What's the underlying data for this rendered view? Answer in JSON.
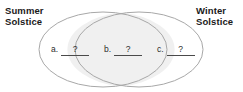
{
  "figure": {
    "type": "venn-diagram",
    "width": 243,
    "height": 92,
    "background_color": "#ffffff",
    "outline_color": "#a8a8a8",
    "overlap_fill_color": "#f0f0f0",
    "text_color": "#1a1a1a"
  },
  "headings": {
    "left": "Summer\nSolstice",
    "right": "Winter\nSolstice"
  },
  "regions": [
    {
      "id": "a",
      "letter": "a.",
      "value": "?",
      "description": "left-only region"
    },
    {
      "id": "b",
      "letter": "b.",
      "value": "?",
      "description": "overlap region"
    },
    {
      "id": "c",
      "letter": "c.",
      "value": "?",
      "description": "right-only region"
    }
  ]
}
